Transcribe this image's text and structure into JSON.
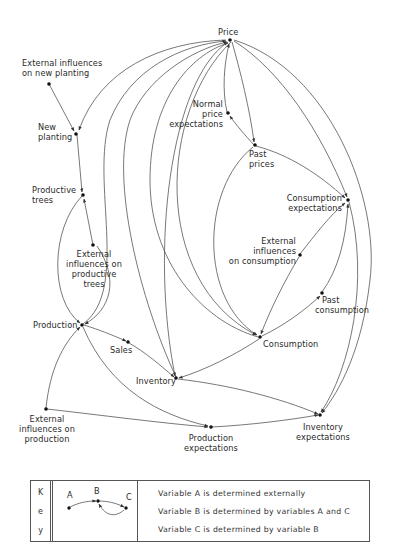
{
  "diagram": {
    "type": "causal-flow",
    "nodes": [
      {
        "id": "price",
        "label": "Price"
      },
      {
        "id": "ext_new_planting",
        "label_lines": [
          "External influences",
          "on new planting"
        ]
      },
      {
        "id": "new_planting",
        "label_lines": [
          "New",
          "planting"
        ]
      },
      {
        "id": "productive_trees",
        "label_lines": [
          "Productive",
          "trees"
        ]
      },
      {
        "id": "ext_productive_trees",
        "label_lines": [
          "External",
          "influences on",
          "productive",
          "trees"
        ]
      },
      {
        "id": "normal_price_expectations",
        "label_lines": [
          "Normal",
          "price",
          "expectations"
        ]
      },
      {
        "id": "past_prices",
        "label_lines": [
          "Past",
          "prices"
        ]
      },
      {
        "id": "consumption_expectations",
        "label_lines": [
          "Consumption",
          "expectations"
        ]
      },
      {
        "id": "ext_consumption",
        "label_lines": [
          "External",
          "influences",
          "on consumption"
        ]
      },
      {
        "id": "past_consumption",
        "label_lines": [
          "Past",
          "consumption"
        ]
      },
      {
        "id": "production",
        "label": "Production"
      },
      {
        "id": "sales",
        "label": "Sales"
      },
      {
        "id": "inventory",
        "label": "Inventory"
      },
      {
        "id": "consumption",
        "label": "Consumption"
      },
      {
        "id": "ext_production",
        "label_lines": [
          "External",
          "influences on",
          "production"
        ]
      },
      {
        "id": "production_expectations",
        "label_lines": [
          "Production",
          "expectations"
        ]
      },
      {
        "id": "inventory_expectations",
        "label_lines": [
          "Inventory",
          "expectations"
        ]
      }
    ],
    "edges": [
      {
        "from": "ext_new_planting",
        "to": "new_planting"
      },
      {
        "from": "price",
        "to": "new_planting"
      },
      {
        "from": "new_planting",
        "to": "productive_trees"
      },
      {
        "from": "ext_productive_trees",
        "to": "productive_trees"
      },
      {
        "from": "productive_trees",
        "to": "production"
      },
      {
        "from": "production",
        "to": "price"
      },
      {
        "from": "sales",
        "to": "price"
      },
      {
        "from": "inventory",
        "to": "price"
      },
      {
        "from": "consumption",
        "to": "price"
      },
      {
        "from": "normal_price_expectations",
        "to": "price"
      },
      {
        "from": "price",
        "to": "past_prices"
      },
      {
        "from": "past_prices",
        "to": "normal_price_expectations"
      },
      {
        "from": "past_prices",
        "to": "consumption_expectations"
      },
      {
        "from": "price",
        "to": "consumption_expectations"
      },
      {
        "from": "price",
        "to": "inventory_expectations"
      },
      {
        "from": "ext_consumption",
        "to": "consumption_expectations"
      },
      {
        "from": "past_consumption",
        "to": "consumption_expectations"
      },
      {
        "from": "consumption",
        "to": "past_consumption"
      },
      {
        "from": "past_prices",
        "to": "consumption"
      },
      {
        "from": "ext_consumption",
        "to": "consumption"
      },
      {
        "from": "price",
        "to": "consumption"
      },
      {
        "from": "consumption_expectations",
        "to": "inventory_expectations"
      },
      {
        "from": "production",
        "to": "sales"
      },
      {
        "from": "sales",
        "to": "inventory"
      },
      {
        "from": "price",
        "to": "inventory"
      },
      {
        "from": "consumption",
        "to": "inventory"
      },
      {
        "from": "inventory",
        "to": "inventory_expectations"
      },
      {
        "from": "production",
        "to": "production_expectations"
      },
      {
        "from": "ext_production",
        "to": "production"
      },
      {
        "from": "ext_production",
        "to": "production_expectations"
      },
      {
        "from": "production_expectations",
        "to": "inventory_expectations"
      }
    ]
  },
  "labels": {
    "price": "Price",
    "ext_new_planting": [
      "External influences",
      "on new planting"
    ],
    "new_planting": [
      "New",
      "planting"
    ],
    "productive_trees": [
      "Productive",
      "trees"
    ],
    "ext_productive_trees": [
      "External",
      "influences on",
      "productive",
      "trees"
    ],
    "normal_price_expectations": [
      "Normal",
      "price",
      "expectations"
    ],
    "past_prices": [
      "Past",
      "prices"
    ],
    "consumption_expectations": [
      "Consumption",
      "expectations"
    ],
    "ext_consumption": [
      "External",
      "influences",
      "on consumption"
    ],
    "past_consumption": [
      "Past",
      "consumption"
    ],
    "production": "Production",
    "sales": "Sales",
    "inventory": "Inventory",
    "consumption": "Consumption",
    "ext_production": [
      "External",
      "influences on",
      "production"
    ],
    "production_expectations": [
      "Production",
      "expectations"
    ],
    "inventory_expectations": [
      "Inventory",
      "expectations"
    ]
  },
  "key": {
    "letters": [
      "K",
      "e",
      "y"
    ],
    "example_nodes": [
      "A",
      "B",
      "C"
    ],
    "lines": [
      "Variable  A  is  determined  externally",
      "Variable  B  is  determined  by  variables  A and C",
      "Variable  C  is  determined  by  variable  B"
    ]
  },
  "colors": {
    "line": "#4a4a4a",
    "node": "#111111",
    "text": "#2a2a2a",
    "background": "#ffffff"
  }
}
